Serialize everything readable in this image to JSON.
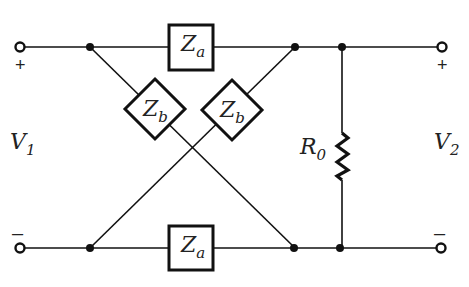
{
  "diagram": {
    "type": "lattice-network-circuit",
    "components": {
      "za_top": {
        "symbol": "Z",
        "subscript": "a"
      },
      "za_bottom": {
        "symbol": "Z",
        "subscript": "a"
      },
      "zb_left": {
        "symbol": "Z",
        "subscript": "b"
      },
      "zb_right": {
        "symbol": "Z",
        "subscript": "b"
      },
      "load": {
        "symbol": "R",
        "subscript": "0"
      }
    },
    "ports": {
      "input": {
        "symbol": "V",
        "subscript": "1",
        "plus": "+",
        "minus": "–"
      },
      "output": {
        "symbol": "V",
        "subscript": "2",
        "plus": "+",
        "minus": "–"
      }
    },
    "colors": {
      "line": "#111111",
      "background": "#ffffff"
    }
  }
}
